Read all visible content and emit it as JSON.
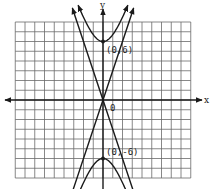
{
  "chart_data": {
    "type": "line",
    "title": "",
    "xlabel": "x",
    "ylabel": "y",
    "origin_label": "0",
    "xlim": [
      -9,
      9
    ],
    "ylim": [
      -8,
      8
    ],
    "grid": true,
    "grid_step": 1,
    "series": [
      {
        "name": "hyperbola upper branch",
        "equation": "y = 6*sqrt(1 + x^2/4)",
        "vertex": [
          0,
          6
        ]
      },
      {
        "name": "hyperbola lower branch",
        "equation": "y = -6*sqrt(1 + x^2/4)",
        "vertex": [
          0,
          -6
        ]
      },
      {
        "name": "asymptote",
        "equation": "y = 3x"
      },
      {
        "name": "asymptote",
        "equation": "y = -3x"
      }
    ],
    "annotations": [
      {
        "text": "(0,6)",
        "x": 0,
        "y": 6
      },
      {
        "text": "(0,-6)",
        "x": 0,
        "y": -6
      }
    ]
  },
  "labels": {
    "x_axis": "x",
    "y_axis": "y",
    "origin": "0",
    "upper_vertex": "(0,6)",
    "lower_vertex": "(0,-6)"
  },
  "colors": {
    "grid": "#6a6a6a",
    "curve": "#1a1a1a",
    "background": "#ffffff"
  }
}
